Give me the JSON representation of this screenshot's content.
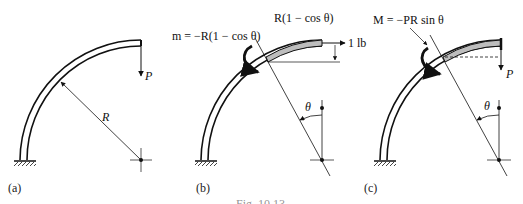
{
  "panels": [
    {
      "id": "a",
      "caption": "(a)",
      "load_label": "P",
      "radius_label": "R"
    },
    {
      "id": "b",
      "caption": "(b)",
      "moment_label": "m = −R(1 − cos θ)",
      "arm_label": "R(1 − cos θ)",
      "force_label": "1 lb",
      "angle_label": "θ"
    },
    {
      "id": "c",
      "caption": "(c)",
      "moment_label": "M = −PR sin θ",
      "load_label": "P",
      "angle_label": "θ"
    }
  ],
  "figure_caption": "Fig. 10.13",
  "colors": {
    "ink": "#111111",
    "shade": "#bdbdbd"
  }
}
